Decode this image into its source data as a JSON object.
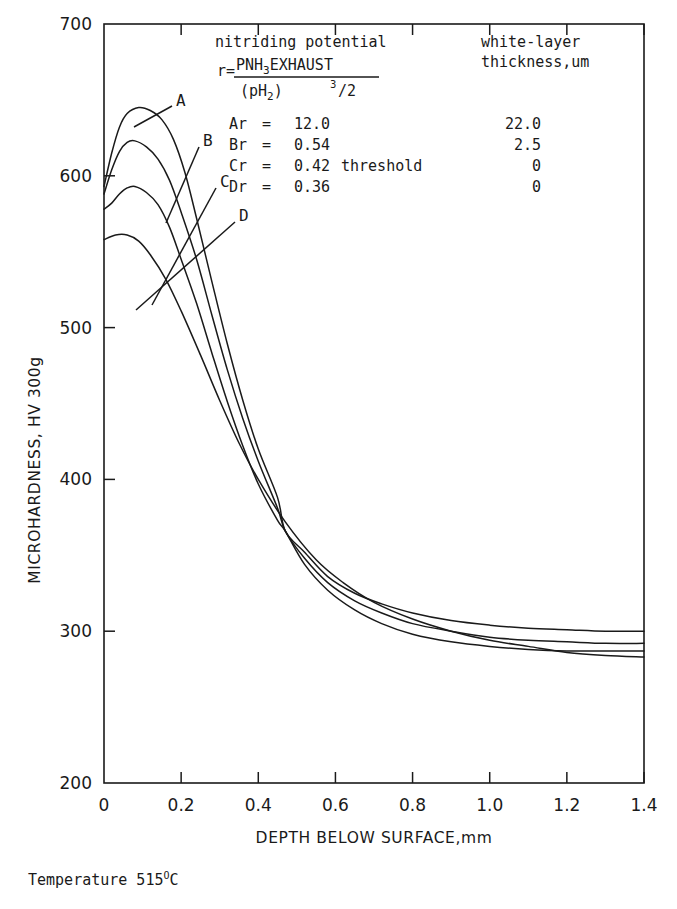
{
  "chart_data": {
    "type": "line",
    "title": "",
    "xlabel": "DEPTH BELOW SURFACE,mm",
    "ylabel": "MICROHARDNESS, HV 300g",
    "xlim": [
      0,
      1.4
    ],
    "ylim": [
      200,
      700
    ],
    "xticks": [
      "0",
      "0.2",
      "0.4",
      "0.6",
      "0.8",
      "1.0",
      "1.2",
      "1.4"
    ],
    "xtick_values": [
      0,
      0.2,
      0.4,
      0.6,
      0.8,
      1.0,
      1.2,
      1.4
    ],
    "yticks": [
      "200",
      "300",
      "400",
      "500",
      "600",
      "700"
    ],
    "ytick_values": [
      200,
      300,
      400,
      500,
      600,
      700
    ],
    "grid": false,
    "legend_position": "top-inside",
    "series": [
      {
        "name": "A",
        "label": "A",
        "nitriding_potential": "12.0",
        "white_layer_thickness": "22.0",
        "points": [
          [
            0.0,
            593
          ],
          [
            0.02,
            615
          ],
          [
            0.04,
            632
          ],
          [
            0.06,
            641
          ],
          [
            0.09,
            645
          ],
          [
            0.12,
            643
          ],
          [
            0.15,
            637
          ],
          [
            0.18,
            624
          ],
          [
            0.21,
            602
          ],
          [
            0.24,
            572
          ],
          [
            0.28,
            530
          ],
          [
            0.32,
            489
          ],
          [
            0.36,
            452
          ],
          [
            0.4,
            420
          ],
          [
            0.45,
            388
          ],
          [
            0.47,
            366
          ],
          [
            0.52,
            352
          ],
          [
            0.58,
            336
          ],
          [
            0.65,
            325
          ],
          [
            0.72,
            318
          ],
          [
            0.8,
            312
          ],
          [
            0.9,
            307
          ],
          [
            1.0,
            304
          ],
          [
            1.1,
            302
          ],
          [
            1.2,
            301
          ],
          [
            1.3,
            300
          ],
          [
            1.4,
            300
          ]
        ]
      },
      {
        "name": "B",
        "label": "B",
        "nitriding_potential": "0.54",
        "white_layer_thickness": "2.5",
        "points": [
          [
            0.0,
            588
          ],
          [
            0.02,
            604
          ],
          [
            0.04,
            616
          ],
          [
            0.06,
            622
          ],
          [
            0.08,
            623
          ],
          [
            0.11,
            619
          ],
          [
            0.14,
            611
          ],
          [
            0.17,
            597
          ],
          [
            0.2,
            576
          ],
          [
            0.24,
            545
          ],
          [
            0.28,
            508
          ],
          [
            0.32,
            472
          ],
          [
            0.36,
            440
          ],
          [
            0.4,
            412
          ],
          [
            0.45,
            381
          ],
          [
            0.47,
            366
          ],
          [
            0.52,
            348
          ],
          [
            0.58,
            332
          ],
          [
            0.65,
            320
          ],
          [
            0.72,
            312
          ],
          [
            0.8,
            305
          ],
          [
            0.9,
            300
          ],
          [
            1.0,
            296
          ],
          [
            1.1,
            294
          ],
          [
            1.2,
            293
          ],
          [
            1.3,
            292
          ],
          [
            1.4,
            292
          ]
        ]
      },
      {
        "name": "C",
        "label": "C",
        "nitriding_potential": "0.42",
        "nitriding_note": "threshold",
        "white_layer_thickness": "0",
        "points": [
          [
            0.0,
            578
          ],
          [
            0.02,
            582
          ],
          [
            0.04,
            588
          ],
          [
            0.06,
            592
          ],
          [
            0.08,
            593
          ],
          [
            0.11,
            589
          ],
          [
            0.14,
            581
          ],
          [
            0.17,
            566
          ],
          [
            0.2,
            545
          ],
          [
            0.24,
            516
          ],
          [
            0.28,
            483
          ],
          [
            0.32,
            451
          ],
          [
            0.36,
            422
          ],
          [
            0.4,
            397
          ],
          [
            0.45,
            373
          ],
          [
            0.47,
            366
          ],
          [
            0.52,
            344
          ],
          [
            0.58,
            327
          ],
          [
            0.65,
            314
          ],
          [
            0.72,
            305
          ],
          [
            0.8,
            298
          ],
          [
            0.9,
            293
          ],
          [
            1.0,
            290
          ],
          [
            1.1,
            288
          ],
          [
            1.2,
            287
          ],
          [
            1.3,
            287
          ],
          [
            1.4,
            287
          ]
        ]
      },
      {
        "name": "D",
        "label": "D",
        "nitriding_potential": "0.36",
        "white_layer_thickness": "0",
        "points": [
          [
            0.0,
            558
          ],
          [
            0.03,
            561
          ],
          [
            0.06,
            561
          ],
          [
            0.09,
            557
          ],
          [
            0.12,
            548
          ],
          [
            0.16,
            532
          ],
          [
            0.2,
            511
          ],
          [
            0.25,
            482
          ],
          [
            0.3,
            452
          ],
          [
            0.35,
            424
          ],
          [
            0.4,
            400
          ],
          [
            0.47,
            372
          ],
          [
            0.55,
            347
          ],
          [
            0.62,
            332
          ],
          [
            0.7,
            319
          ],
          [
            0.8,
            308
          ],
          [
            0.9,
            300
          ],
          [
            1.0,
            294
          ],
          [
            1.1,
            290
          ],
          [
            1.2,
            286
          ],
          [
            1.3,
            284
          ],
          [
            1.4,
            283
          ]
        ]
      }
    ]
  },
  "legend": {
    "header_left": "nitriding potential",
    "header_right_line1": "white-layer",
    "header_right_line2": "thickness,um",
    "formula_lhs": "r=",
    "formula_numerator_a": "PNH",
    "formula_numerator_sub": "3",
    "formula_numerator_b": "EXHAUST",
    "formula_denominator_a": "(pH",
    "formula_denominator_sub": "2",
    "formula_denominator_b": ")",
    "formula_exponent": "3",
    "formula_exponent_div": "/2",
    "rows": [
      {
        "name": "Ar",
        "eq": "=",
        "value": "12.0",
        "note": "",
        "thickness": "22.0"
      },
      {
        "name": "Br",
        "eq": "=",
        "value": "0.54",
        "note": "",
        "thickness": "2.5"
      },
      {
        "name": "Cr",
        "eq": "=",
        "value": "0.42",
        "note": "threshold",
        "thickness": "0"
      },
      {
        "name": "Dr",
        "eq": "=",
        "value": "0.36",
        "note": "",
        "thickness": "0"
      }
    ]
  },
  "footnote": {
    "prefix": "Temperature 515",
    "degree": "O",
    "suffix": "C"
  },
  "axes": {
    "x_title": "DEPTH BELOW SURFACE,mm",
    "y_title": "MICROHARDNESS, HV 300g"
  },
  "colors": {
    "ink": "#1a1a1a",
    "background": "#ffffff"
  }
}
